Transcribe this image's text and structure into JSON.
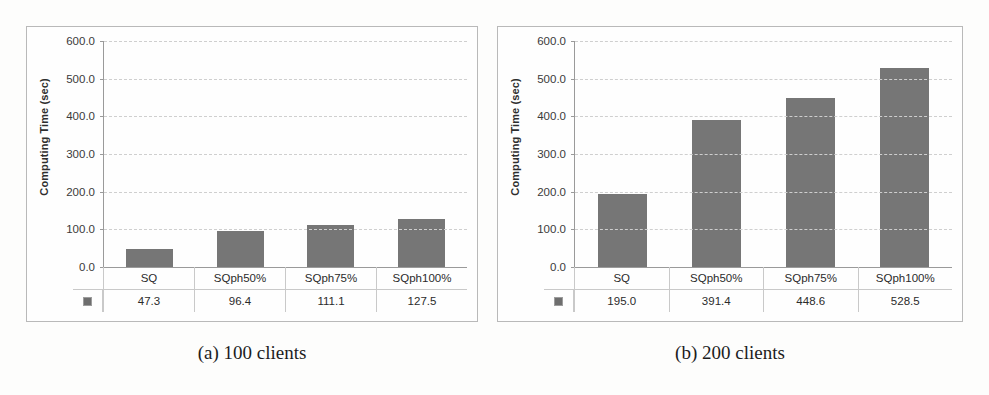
{
  "figure": {
    "panels": [
      {
        "id": "panel-a",
        "caption": "(a) 100 clients",
        "legend_marker": "square-swatch",
        "chart_data": {
          "type": "bar",
          "title": "",
          "xlabel": "",
          "ylabel": "Computing Time (sec)",
          "categories": [
            "SQ",
            "SQph50%",
            "SQph75%",
            "SQph100%"
          ],
          "values": [
            47.3,
            96.4,
            111.1,
            127.5
          ],
          "value_labels": [
            "47.3",
            "96.4",
            "111.1",
            "127.5"
          ],
          "ylim": [
            0,
            600
          ],
          "yticks": [
            0,
            100,
            200,
            300,
            400,
            500,
            600
          ],
          "ytick_labels": [
            "0.0",
            "100.0",
            "200.0",
            "300.0",
            "400.0",
            "500.0",
            "600.0"
          ],
          "grid": true,
          "legend_position": "data-table",
          "series": [
            {
              "name": "",
              "color": "#767676",
              "values": [
                47.3,
                96.4,
                111.1,
                127.5
              ]
            }
          ]
        }
      },
      {
        "id": "panel-b",
        "caption": "(b) 200 clients",
        "legend_marker": "square-swatch",
        "chart_data": {
          "type": "bar",
          "title": "",
          "xlabel": "",
          "ylabel": "Computing Time (sec)",
          "categories": [
            "SQ",
            "SQph50%",
            "SQph75%",
            "SQph100%"
          ],
          "values": [
            195.0,
            391.4,
            448.6,
            528.5
          ],
          "value_labels": [
            "195.0",
            "391.4",
            "448.6",
            "528.5"
          ],
          "ylim": [
            0,
            600
          ],
          "yticks": [
            0,
            100,
            200,
            300,
            400,
            500,
            600
          ],
          "ytick_labels": [
            "0.0",
            "100.0",
            "200.0",
            "300.0",
            "400.0",
            "500.0",
            "600.0"
          ],
          "grid": true,
          "legend_position": "data-table",
          "series": [
            {
              "name": "",
              "color": "#767676",
              "values": [
                195.0,
                391.4,
                448.6,
                528.5
              ]
            }
          ]
        }
      }
    ]
  },
  "colors": {
    "bar": "#767676",
    "grid": "#cfcfcf",
    "axis": "#9a9a9a",
    "panel_border": "#b9b9b9",
    "text": "#2b2b2b"
  }
}
